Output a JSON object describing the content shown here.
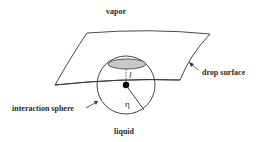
{
  "diagram": {
    "labels": {
      "vapor": "vapor",
      "drop_surface": "drop surface",
      "interaction_sphere": "interaction sphere",
      "liquid": "liquid"
    },
    "symbols": {
      "radius": "η",
      "distance": "l"
    },
    "elements": [
      {
        "id": "drop-surface",
        "shape": "curved quadrilateral sheet",
        "label": "drop surface"
      },
      {
        "id": "interaction-sphere",
        "shape": "circle",
        "label": "interaction sphere"
      },
      {
        "id": "cap",
        "shape": "gray ellipse",
        "description": "portion of interaction sphere above drop surface"
      },
      {
        "id": "particle",
        "shape": "black dot",
        "description": "molecule at sphere center"
      },
      {
        "id": "radius-line",
        "label": "η"
      },
      {
        "id": "distance-line",
        "style": "dashed",
        "label": "l"
      }
    ],
    "regions": {
      "above": "vapor",
      "below": "liquid"
    },
    "colors": {
      "stroke": "#333333",
      "cap_fill": "#c8c8c8",
      "particle": "#000000",
      "background": "#ffffff"
    }
  }
}
